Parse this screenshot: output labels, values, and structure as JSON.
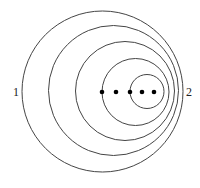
{
  "diagram": {
    "type": "nested-circles",
    "labels": {
      "left": "1",
      "right": "2"
    },
    "stroke_color": "#444444",
    "dot_color": "#000000",
    "circles": [
      {
        "cx": 102.5,
        "cy": 91.5,
        "r": 80.5
      },
      {
        "cx": 113.5,
        "cy": 90.5,
        "r": 65
      },
      {
        "cx": 125,
        "cy": 91,
        "r": 49.5
      },
      {
        "cx": 135.5,
        "cy": 92,
        "r": 33.5
      },
      {
        "cx": 147,
        "cy": 91.5,
        "r": 17
      }
    ],
    "dots": [
      {
        "cx": 102,
        "cy": 92
      },
      {
        "cx": 116,
        "cy": 92
      },
      {
        "cx": 130,
        "cy": 92
      },
      {
        "cx": 142,
        "cy": 92
      },
      {
        "cx": 154,
        "cy": 92
      }
    ]
  }
}
